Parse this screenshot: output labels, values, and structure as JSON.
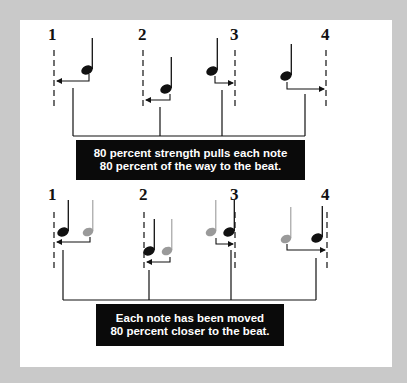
{
  "diagram": {
    "colors": {
      "background": "#c9c9c9",
      "panel": "#ffffff",
      "ink": "#111111",
      "original_note": "#9a9a9a",
      "caption_bg": "#0a0a0a",
      "caption_text": "#ffffff"
    },
    "top": {
      "beats": [
        {
          "label": "1",
          "x": 54
        },
        {
          "label": "2",
          "x": 143
        },
        {
          "label": "3",
          "x": 235
        },
        {
          "label": "4",
          "x": 326
        }
      ],
      "caption": {
        "line1": "80 percent strength pulls each note",
        "line2": "80 percent of the way to the beat."
      }
    },
    "bottom": {
      "beats": [
        {
          "label": "1",
          "x": 54
        },
        {
          "label": "2",
          "x": 144
        },
        {
          "label": "3",
          "x": 235
        },
        {
          "label": "4",
          "x": 327
        }
      ],
      "legend": {
        "black_note": "quantized position",
        "gray_note": "original position"
      },
      "caption": {
        "line1": "Each note has been moved",
        "line2": "80 percent closer to the beat."
      }
    }
  }
}
